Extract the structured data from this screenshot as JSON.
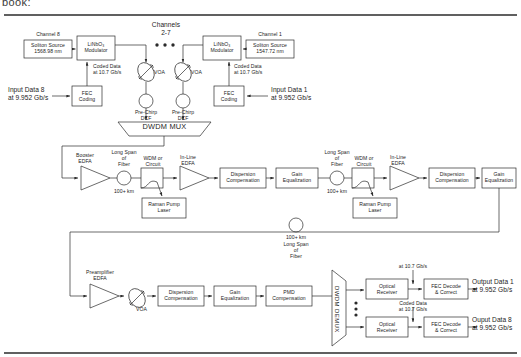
{
  "page": {
    "header_fragment": "book:",
    "diagram_title": "DWDM soliton optical transmission system block diagram"
  },
  "transmitter": {
    "channel8": {
      "channel_label": "Channel 8",
      "source_label": "Soliton Source\n1568.98 nm",
      "modulator_label": "LiNbO₃\nModulator",
      "fec_label": "FEC\nCoding",
      "input_label": "Input Data 8\nat 9.952 Gb/s",
      "coded_label": "Coded Data\nat 10.7 Gb/s",
      "voa_label": "VOA",
      "dcf_label": "Pre-Chirp\nDCF"
    },
    "channel1": {
      "channel_label": "Channel 1",
      "source_label": "Soliton Source\n1547.72 nm",
      "modulator_label": "LiNbO₃\nModulator",
      "fec_label": "FEC\nCoding",
      "input_label": "Input Data 1\nat 9.952 Gb/s",
      "coded_label": "Coded Data\nat 10.7 Gb/s",
      "voa_label": "VOA",
      "dcf_label": "Pre-Chirp\nDCF"
    },
    "middle_channels_label": "Channels\n2-7",
    "mux_label": "DWDM MUX"
  },
  "span1": {
    "booster_label": "Booster\nEDFA",
    "fiber_label": "Long Span\nof\nFiber",
    "fiber_length": "100+ km",
    "wdm_label": "WDM or\nCircuit",
    "raman_label": "Raman Pump\nLaser",
    "inline_label": "In-Line\nEDFA",
    "dispersion_label": "Dispersion\nCompensation",
    "gain_label": "Gain\nEqualization"
  },
  "span2": {
    "fiber_label": "Long Span\nof\nFiber",
    "fiber_length": "100+ km",
    "wdm_label": "WDM or\nCircuit",
    "raman_label": "Raman Pump\nLaser",
    "inline_label": "In-Line\nEDFA",
    "dispersion_label": "Dispersion\nCompensation",
    "gain_label": "Gain\nEqualization"
  },
  "span3": {
    "fiber_length": "100+ km",
    "fiber_label": "Long Span\nof\nFiber"
  },
  "receiver": {
    "preamp_label": "Preamplifier\nEDFA",
    "voa_label": "VOA",
    "dispersion_label": "Dispersion\nCompensation",
    "gain_label": "Gain\nEqualization",
    "pmd_label": "PMD\nCompensation",
    "demux_label": "DWDM DEMUX",
    "channel1": {
      "coded_label": "at 10.7 Gb/s",
      "receiver_label": "Optical\nReceiver",
      "fec_label": "FEC Decode\n& Correct",
      "output_label": "Output Data 1\nat 9.952 Gb/s"
    },
    "channel8": {
      "coded_label": "Coded Data\nat 10.7 Gb/s",
      "receiver_label": "Optical\nReceiver",
      "fec_label": "FEC Decode\n& Correct",
      "output_label": "Ouput Data 8\nat 9.952 Gb/s"
    }
  },
  "colors": {
    "line": "#2b2b2b",
    "text": "#1d1d1d",
    "background": "#ffffff"
  }
}
